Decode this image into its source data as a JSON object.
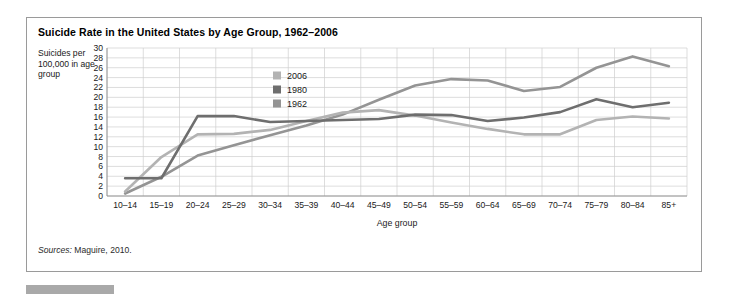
{
  "figure": {
    "title": "Suicide Rate in the United States by Age Group, 1962–2006",
    "sources_label": "Sources:",
    "sources_text": " Maguire, 2010.",
    "y_axis_caption": "Suicides per 100,000 in age group"
  },
  "chart_data": {
    "type": "line",
    "title": "Suicide Rate in the United States by Age Group, 1962–2006",
    "xlabel": "Age group",
    "ylabel": "Suicides per 100,000 in age group",
    "ylim": [
      0,
      30
    ],
    "ytick_step": 2,
    "yticks": [
      0,
      2,
      4,
      6,
      8,
      10,
      12,
      14,
      16,
      18,
      20,
      22,
      24,
      26,
      28,
      30
    ],
    "grid": true,
    "legend_position": "upper-center-left",
    "categories": [
      "10–14",
      "15–19",
      "20–24",
      "25–29",
      "30–34",
      "35–39",
      "40–44",
      "45–49",
      "50–54",
      "55–59",
      "60–64",
      "65–69",
      "70–74",
      "75–79",
      "80–84",
      "85+"
    ],
    "series": [
      {
        "name": "2006",
        "color": "#b3b3b3",
        "values": [
          0.9,
          7.9,
          12.5,
          12.6,
          13.4,
          15.2,
          16.9,
          17.4,
          16.3,
          14.9,
          13.6,
          12.5,
          12.5,
          15.4,
          16.1,
          15.7
        ]
      },
      {
        "name": "1980",
        "color": "#6e6e6e",
        "values": [
          3.6,
          3.6,
          16.2,
          16.2,
          15.0,
          15.2,
          15.4,
          15.6,
          16.5,
          16.4,
          15.2,
          15.9,
          17.0,
          19.6,
          18.0,
          18.9
        ]
      },
      {
        "name": "1962",
        "color": "#949494",
        "values": [
          0.5,
          3.9,
          8.2,
          10.3,
          12.3,
          14.3,
          16.5,
          19.5,
          22.4,
          23.7,
          23.4,
          21.3,
          22.1,
          26.0,
          28.3,
          26.3
        ]
      }
    ]
  }
}
